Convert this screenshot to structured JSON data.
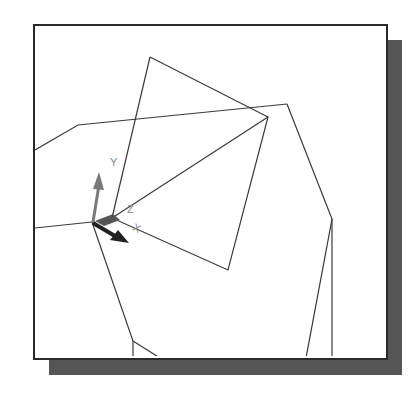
{
  "viewport": {
    "background": "#ffffff",
    "border_color": "#2a2a2a",
    "shadow_color": "#555555",
    "line_color": "#3a3a3a"
  },
  "ucs_icon": {
    "labels": {
      "x": "X",
      "y": "Y",
      "z": "Z"
    },
    "colors": {
      "y_arrow": "#7a7a7a",
      "x_arrow": "#222222",
      "z_arrow": "#555555"
    }
  },
  "wireframe": {
    "lines": [
      [
        35,
        150,
        78,
        125,
        287,
        104
      ],
      [
        150,
        57,
        268,
        117,
        228,
        270,
        112,
        218,
        150,
        57
      ],
      [
        112,
        218,
        268,
        117
      ],
      [
        287,
        104,
        332,
        219,
        306,
        358
      ],
      [
        332,
        219,
        332,
        358
      ],
      [
        35,
        228,
        92,
        222
      ],
      [
        92,
        222,
        133,
        341,
        133,
        358
      ],
      [
        133,
        341,
        160,
        358
      ]
    ]
  }
}
